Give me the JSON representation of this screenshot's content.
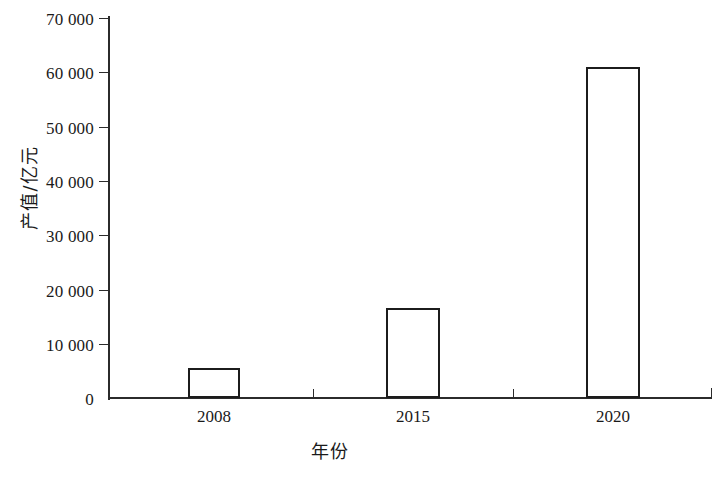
{
  "chart_data": {
    "type": "bar",
    "title": "",
    "subtitle": "",
    "xlabel": "年份",
    "ylabel": "产值/亿元",
    "categories": [
      "2008",
      "2015",
      "2020"
    ],
    "values": [
      5500,
      16500,
      61000
    ],
    "series": [
      {
        "name": "产值",
        "values": [
          5500,
          16500,
          61000
        ]
      }
    ],
    "ylim": [
      0,
      70000
    ],
    "ytick_values": [
      0,
      10000,
      20000,
      30000,
      40000,
      50000,
      60000,
      70000
    ],
    "ytick_labels": [
      "0",
      "10 000",
      "20 000",
      "30 000",
      "40 000",
      "50 000",
      "60 000",
      "70 000"
    ],
    "xtick_labels": [
      "2008",
      "2015",
      "2020"
    ],
    "grid": false,
    "legend": false,
    "legend_position": "none",
    "bar_fill_color": "#ffffff",
    "bar_edge_color": "#1c1c1c",
    "axis_color": "#2b2b2b",
    "background_color": "#ffffff"
  },
  "figure": {
    "bars": [
      {
        "category": "2008",
        "value": 5500,
        "left_px": 188,
        "width_px": 52,
        "top_px": 368
      },
      {
        "category": "2015",
        "value": 16500,
        "left_px": 386,
        "width_px": 54,
        "top_px": 306
      },
      {
        "category": "2020",
        "value": 61000,
        "left_px": 586,
        "width_px": 54,
        "top_px": 68
      }
    ],
    "xtick_positions_px": [
      214,
      313,
      413,
      513,
      613,
      712
    ],
    "xlabel_positions_px": [
      214,
      413,
      613
    ]
  }
}
